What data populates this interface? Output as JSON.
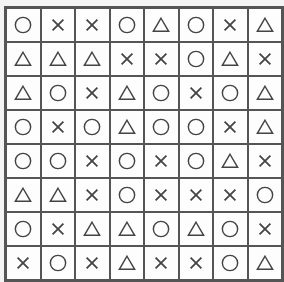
{
  "board": {
    "rows": 8,
    "cols": 8,
    "cells": [
      [
        "circle",
        "cross",
        "cross",
        "circle",
        "triangle",
        "circle",
        "cross",
        "triangle"
      ],
      [
        "triangle",
        "triangle",
        "triangle",
        "cross",
        "cross",
        "circle",
        "triangle",
        "cross"
      ],
      [
        "triangle",
        "circle",
        "cross",
        "triangle",
        "circle",
        "cross",
        "circle",
        "triangle"
      ],
      [
        "circle",
        "cross",
        "circle",
        "triangle",
        "circle",
        "circle",
        "cross",
        "triangle"
      ],
      [
        "circle",
        "circle",
        "cross",
        "circle",
        "cross",
        "circle",
        "triangle",
        "cross"
      ],
      [
        "triangle",
        "triangle",
        "cross",
        "circle",
        "cross",
        "cross",
        "cross",
        "circle"
      ],
      [
        "circle",
        "cross",
        "triangle",
        "triangle",
        "circle",
        "triangle",
        "circle",
        "cross"
      ],
      [
        "cross",
        "circle",
        "cross",
        "triangle",
        "cross",
        "cross",
        "circle",
        "triangle"
      ]
    ]
  },
  "colors": {
    "line": "#555555",
    "symbol": "#444444",
    "cell_bg": "#fdfdfd"
  }
}
